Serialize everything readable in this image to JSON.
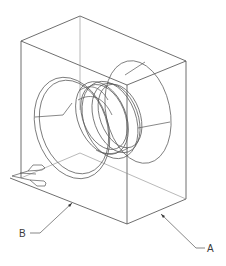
{
  "figure": {
    "title": "",
    "stroke_color": "#4a4a4a",
    "background": "#ffffff"
  },
  "labels": {
    "a": "A",
    "b": "B"
  }
}
